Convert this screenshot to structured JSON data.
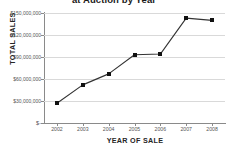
{
  "chart_data": {
    "type": "line",
    "title_visible_fragment": "at Auction by Year",
    "xlabel": "YEAR OF SALE",
    "ylabel": "TOTAL SALES",
    "categories": [
      "2002",
      "2003",
      "2004",
      "2005",
      "2006",
      "2007",
      "2008"
    ],
    "values": [
      27000000,
      52000000,
      67000000,
      93000000,
      94000000,
      143000000,
      140000000
    ],
    "value_labels": [
      "$27,000,000",
      "$52,000,000",
      "$67,000,000",
      "$93,000,000",
      "$94,000,000",
      "$143,000,000",
      "$140,000,000"
    ],
    "ylim": [
      0,
      150000000
    ],
    "ytick_values": [
      0,
      30000000,
      60000000,
      90000000,
      120000000,
      150000000
    ],
    "ytick_labels": [
      "$-",
      "$30,000,000",
      "$60,000,000",
      "$90,000,000",
      "$120,000,000",
      "$150,000,000"
    ],
    "grid": true,
    "grid_axis": "y",
    "legend": false,
    "legend_position": "none",
    "marker": "square",
    "line_color": "#333333",
    "marker_color": "#111111",
    "grid_color": "#d9d9d9",
    "axis_color": "#8a8a8a",
    "background": "#ffffff"
  }
}
